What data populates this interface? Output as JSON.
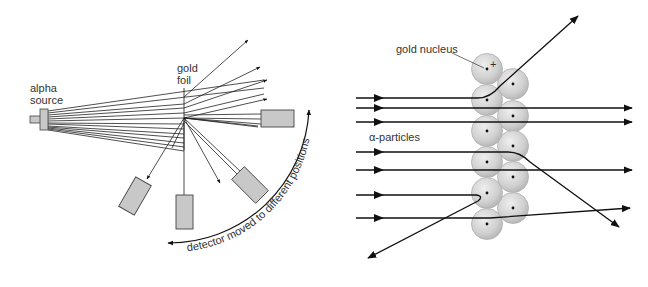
{
  "left_diagram": {
    "title": "Rutherford scattering apparatus",
    "labels": {
      "source_line1": "alpha",
      "source_line2": "source",
      "foil_line1": "gold",
      "foil_line2": "foil",
      "arc_caption": "detector moved to different positions"
    },
    "colors": {
      "line": "#222222",
      "detector_fill": "#c8c8c8",
      "detector_stroke": "#444444"
    }
  },
  "right_diagram": {
    "title": "Alpha particles passing gold nuclei",
    "labels": {
      "nucleus": "gold nucleus",
      "nucleus_charge": "+",
      "particles": "α-particles"
    },
    "colors": {
      "nucleus_fill": "#d4d4d4",
      "nucleus_stroke": "#b0b0b0",
      "path": "#111111"
    }
  }
}
